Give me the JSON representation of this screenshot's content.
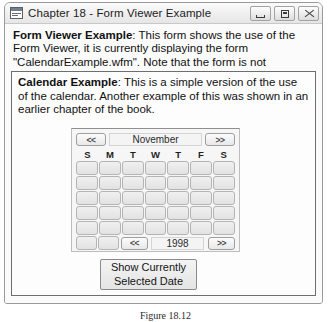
{
  "window": {
    "title": "Chapter 18 - Form Viewer Example",
    "app_icon": "form-window-icon",
    "controls": {
      "minimize": "minimize-icon",
      "maximize": "maximize-icon",
      "close": "close-icon"
    }
  },
  "intro": {
    "lead": "Form Viewer Example",
    "separator": ":",
    "body": " This form shows the use of the Form Viewer, it is currently displaying the form \"CalendarExample.wfm\". Note that the form is not interactive."
  },
  "form_panel": {
    "description": {
      "lead": "Calendar Example",
      "separator": ":",
      "body": " This is a simple version of the use of the calendar. Another example of this was shown in an earlier chapter of the book."
    },
    "calendar": {
      "prev_month_label": "<<",
      "month": "November",
      "next_month_label": ">>",
      "day_headers": [
        "S",
        "M",
        "T",
        "W",
        "T",
        "F",
        "S"
      ],
      "weeks": [
        [
          "",
          "",
          "",
          "",
          "",
          "",
          ""
        ],
        [
          "",
          "",
          "",
          "",
          "",
          "",
          ""
        ],
        [
          "",
          "",
          "",
          "",
          "",
          "",
          ""
        ],
        [
          "",
          "",
          "",
          "",
          "",
          "",
          ""
        ],
        [
          "",
          "",
          "",
          "",
          "",
          "",
          ""
        ]
      ],
      "trailing_cells": [
        "",
        ""
      ],
      "prev_year_label": "<<",
      "year": "1998",
      "next_year_label": ">>"
    },
    "show_date_button": {
      "line1": "Show Currently",
      "line2": "Selected Date"
    }
  },
  "caption": "Figure 18.12",
  "colors": {
    "window_border": "#9a9a9a",
    "titlebar_bg": "#f0f0f0",
    "client_bg": "#fbfbfb",
    "panel_border": "#6e6e6e",
    "calendar_bg": "#f6f6f6",
    "cell_face": "#e8e8e8",
    "text": "#111111"
  }
}
